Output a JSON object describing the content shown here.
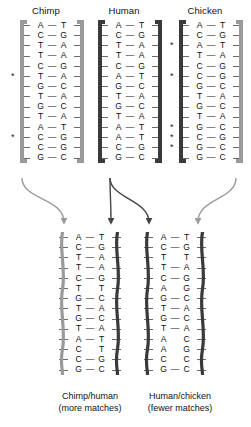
{
  "figure": {
    "colors": {
      "backbone_light": "#9a9a9a",
      "backbone_dark": "#3a3a3a",
      "arrow_light": "#9a9a9a",
      "arrow_dark": "#444444",
      "text": "#111111"
    }
  },
  "top_sequences": [
    {
      "name": "chimp",
      "label": "Chimp",
      "backbone_left": "light",
      "backbone_right": "light",
      "rows": [
        {
          "left": "A",
          "bond": "—",
          "right": "T",
          "marked": false
        },
        {
          "left": "C",
          "bond": "—",
          "right": "G",
          "marked": false
        },
        {
          "left": "T",
          "bond": "—",
          "right": "A",
          "marked": false
        },
        {
          "left": "T",
          "bond": "—",
          "right": "A",
          "marked": false
        },
        {
          "left": "C",
          "bond": "—",
          "right": "G",
          "marked": false
        },
        {
          "left": "T",
          "bond": "—",
          "right": "A",
          "marked": true
        },
        {
          "left": "G",
          "bond": "—",
          "right": "C",
          "marked": false
        },
        {
          "left": "T",
          "bond": "—",
          "right": "A",
          "marked": false
        },
        {
          "left": "G",
          "bond": "—",
          "right": "C",
          "marked": false
        },
        {
          "left": "T",
          "bond": "—",
          "right": "A",
          "marked": false
        },
        {
          "left": "A",
          "bond": "—",
          "right": "T",
          "marked": false
        },
        {
          "left": "C",
          "bond": "—",
          "right": "G",
          "marked": true
        },
        {
          "left": "C",
          "bond": "—",
          "right": "G",
          "marked": false
        },
        {
          "left": "G",
          "bond": "—",
          "right": "C",
          "marked": false
        }
      ]
    },
    {
      "name": "human",
      "label": "Human",
      "backbone_left": "dark",
      "backbone_right": "dark",
      "rows": [
        {
          "left": "A",
          "bond": "—",
          "right": "T",
          "marked": false
        },
        {
          "left": "C",
          "bond": "—",
          "right": "G",
          "marked": false
        },
        {
          "left": "T",
          "bond": "—",
          "right": "A",
          "marked": false
        },
        {
          "left": "T",
          "bond": "—",
          "right": "A",
          "marked": false
        },
        {
          "left": "C",
          "bond": "—",
          "right": "G",
          "marked": false
        },
        {
          "left": "A",
          "bond": "—",
          "right": "T",
          "marked": false
        },
        {
          "left": "G",
          "bond": "—",
          "right": "C",
          "marked": false
        },
        {
          "left": "T",
          "bond": "—",
          "right": "A",
          "marked": false
        },
        {
          "left": "G",
          "bond": "—",
          "right": "C",
          "marked": false
        },
        {
          "left": "T",
          "bond": "—",
          "right": "A",
          "marked": false
        },
        {
          "left": "A",
          "bond": "—",
          "right": "T",
          "marked": false
        },
        {
          "left": "A",
          "bond": "—",
          "right": "T",
          "marked": false
        },
        {
          "left": "C",
          "bond": "—",
          "right": "G",
          "marked": false
        },
        {
          "left": "G",
          "bond": "—",
          "right": "C",
          "marked": false
        }
      ]
    },
    {
      "name": "chicken",
      "label": "Chicken",
      "backbone_left": "dark",
      "backbone_right": "light",
      "rows": [
        {
          "left": "A",
          "bond": "—",
          "right": "T",
          "marked": false
        },
        {
          "left": "C",
          "bond": "—",
          "right": "G",
          "marked": false
        },
        {
          "left": "A",
          "bond": "—",
          "right": "T",
          "marked": true
        },
        {
          "left": "T",
          "bond": "—",
          "right": "A",
          "marked": false
        },
        {
          "left": "C",
          "bond": "—",
          "right": "G",
          "marked": false
        },
        {
          "left": "C",
          "bond": "—",
          "right": "G",
          "marked": true
        },
        {
          "left": "G",
          "bond": "—",
          "right": "C",
          "marked": false
        },
        {
          "left": "T",
          "bond": "—",
          "right": "A",
          "marked": false
        },
        {
          "left": "G",
          "bond": "—",
          "right": "C",
          "marked": false
        },
        {
          "left": "T",
          "bond": "—",
          "right": "A",
          "marked": false
        },
        {
          "left": "G",
          "bond": "—",
          "right": "C",
          "marked": true
        },
        {
          "left": "C",
          "bond": "—",
          "right": "G",
          "marked": true
        },
        {
          "left": "G",
          "bond": "—",
          "right": "C",
          "marked": true
        },
        {
          "left": "G",
          "bond": "—",
          "right": "C",
          "marked": false
        }
      ]
    }
  ],
  "hybrids": [
    {
      "name": "chimp-human",
      "caption_line1": "Chimp/human",
      "caption_line2": "(more matches)",
      "backbone_left": "light",
      "backbone_right": "dark",
      "rows": [
        {
          "left": "A",
          "bond": "—",
          "right": "T",
          "match": true
        },
        {
          "left": "C",
          "bond": "—",
          "right": "G",
          "match": true
        },
        {
          "left": "T",
          "bond": "—",
          "right": "A",
          "match": true
        },
        {
          "left": "T",
          "bond": "—",
          "right": "A",
          "match": true
        },
        {
          "left": "C",
          "bond": "—",
          "right": "G",
          "match": true
        },
        {
          "left": "T",
          "bond": "",
          "right": "T",
          "match": false
        },
        {
          "left": "G",
          "bond": "—",
          "right": "C",
          "match": true
        },
        {
          "left": "T",
          "bond": "—",
          "right": "A",
          "match": true
        },
        {
          "left": "G",
          "bond": "—",
          "right": "C",
          "match": true
        },
        {
          "left": "T",
          "bond": "—",
          "right": "A",
          "match": true
        },
        {
          "left": "A",
          "bond": "—",
          "right": "T",
          "match": true
        },
        {
          "left": "C",
          "bond": "",
          "right": "T",
          "match": false
        },
        {
          "left": "C",
          "bond": "—",
          "right": "G",
          "match": true
        },
        {
          "left": "G",
          "bond": "—",
          "right": "C",
          "match": true
        }
      ]
    },
    {
      "name": "human-chicken",
      "caption_line1": "Human/chicken",
      "caption_line2": "(fewer matches)",
      "backbone_left": "dark",
      "backbone_right": "dark",
      "rows": [
        {
          "left": "A",
          "bond": "—",
          "right": "T",
          "match": true
        },
        {
          "left": "C",
          "bond": "—",
          "right": "G",
          "match": true
        },
        {
          "left": "T",
          "bond": "",
          "right": "T",
          "match": false
        },
        {
          "left": "T",
          "bond": "—",
          "right": "A",
          "match": true
        },
        {
          "left": "C",
          "bond": "—",
          "right": "G",
          "match": true
        },
        {
          "left": "A",
          "bond": "",
          "right": "G",
          "match": false
        },
        {
          "left": "G",
          "bond": "—",
          "right": "C",
          "match": true
        },
        {
          "left": "T",
          "bond": "—",
          "right": "A",
          "match": true
        },
        {
          "left": "G",
          "bond": "—",
          "right": "C",
          "match": true
        },
        {
          "left": "T",
          "bond": "—",
          "right": "A",
          "match": true
        },
        {
          "left": "A",
          "bond": "",
          "right": "C",
          "match": false
        },
        {
          "left": "A",
          "bond": "",
          "right": "G",
          "match": false
        },
        {
          "left": "C",
          "bond": "",
          "right": "C",
          "match": false
        },
        {
          "left": "G",
          "bond": "—",
          "right": "C",
          "match": true
        }
      ]
    }
  ],
  "marker_symbol": "*"
}
